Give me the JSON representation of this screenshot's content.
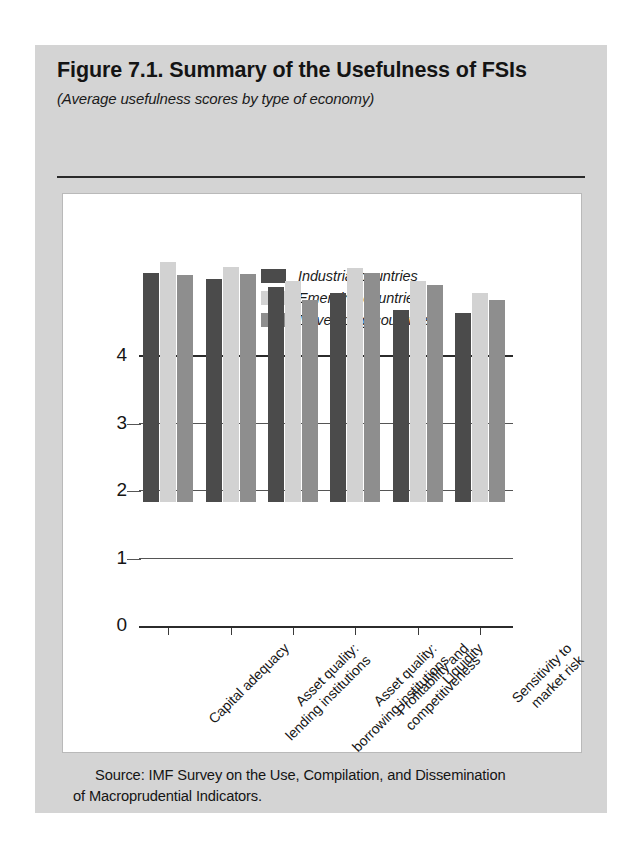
{
  "figure": {
    "title": "Figure 7.1.  Summary of the Usefulness of FSIs",
    "subtitle": "(Average usefulness scores by type of economy)",
    "source_line_1": "Source: IMF Survey on the Use, Compilation, and Dissemination",
    "source_line_2": "of Macroprudential Indicators."
  },
  "colors": {
    "industrial": "#4b4b4b",
    "emerging": "#d2d2d2",
    "developing": "#8e8e8e",
    "panel_background": "#d4d4d4",
    "card_background": "#ffffff",
    "axis": "#2b2b2b"
  },
  "chart_data": {
    "type": "bar",
    "title": "Figure 7.1.  Summary of the Usefulness of FSIs",
    "subtitle": "(Average usefulness scores by type of economy)",
    "xlabel": "",
    "ylabel": "",
    "ylim": [
      0,
      4
    ],
    "yticks": [
      0,
      1,
      2,
      3,
      4
    ],
    "ytick_labels": [
      "0",
      "1",
      "2",
      "3",
      "4"
    ],
    "grid": true,
    "legend_position": "top-center",
    "categories": [
      "Capital adequacy",
      "Asset quality: lending institutions",
      "Asset quality: borrowing institutions",
      "Profitability and competitiveness",
      "Liquidity",
      "Sensitivity to market risk"
    ],
    "category_lines": [
      [
        "Capital adequacy"
      ],
      [
        "Asset quality:",
        "lending institutions"
      ],
      [
        "Asset quality:",
        "borrowing institutions"
      ],
      [
        "Profitability and",
        "competitiveness"
      ],
      [
        "Liquidity"
      ],
      [
        "Sensitivity to",
        "market risk"
      ]
    ],
    "series": [
      {
        "name": "Industrial countries",
        "color": "#4b4b4b",
        "values": [
          3.4,
          3.3,
          3.18,
          3.1,
          2.85,
          2.8
        ]
      },
      {
        "name": "Emerging countries",
        "color": "#d2d2d2",
        "values": [
          3.55,
          3.48,
          3.27,
          3.46,
          3.27,
          3.1
        ]
      },
      {
        "name": "Developing countries",
        "color": "#8e8e8e",
        "values": [
          3.37,
          3.38,
          3.0,
          3.4,
          3.22,
          3.0
        ]
      }
    ]
  }
}
